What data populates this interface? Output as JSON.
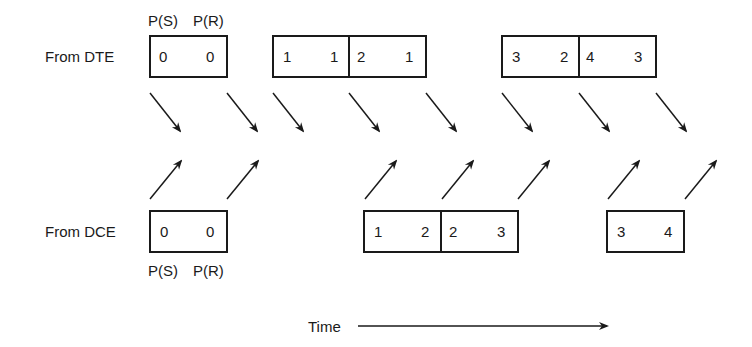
{
  "diagram": {
    "type": "sequence-timing",
    "rows": {
      "dte": {
        "label": "From DTE",
        "header_labels": [
          "P(S)",
          "P(R)"
        ],
        "frames": [
          {
            "ps": "0",
            "pr": "0"
          },
          {
            "ps": "1",
            "pr": "1"
          },
          {
            "ps": "2",
            "pr": "1"
          },
          {
            "ps": "3",
            "pr": "2"
          },
          {
            "ps": "4",
            "pr": "3"
          }
        ]
      },
      "dce": {
        "label": "From DCE",
        "footer_labels": [
          "P(S)",
          "P(R)"
        ],
        "frames": [
          {
            "ps": "0",
            "pr": "0"
          },
          {
            "ps": "1",
            "pr": "2"
          },
          {
            "ps": "2",
            "pr": "3"
          },
          {
            "ps": "3",
            "pr": "4"
          }
        ]
      }
    },
    "time_axis": {
      "label": "Time"
    }
  }
}
